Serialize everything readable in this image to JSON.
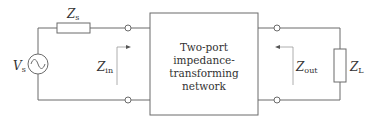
{
  "diagram": {
    "source": {
      "symbol": "V",
      "subscript": "s"
    },
    "source_impedance": {
      "symbol": "Z",
      "subscript": "s"
    },
    "input_impedance": {
      "symbol": "Z",
      "subscript": "in"
    },
    "output_impedance": {
      "symbol": "Z",
      "subscript": "out"
    },
    "load_impedance": {
      "symbol": "Z",
      "subscript": "L"
    },
    "network": {
      "lines": [
        "Two-port",
        "impedance-",
        "transforming",
        "network"
      ]
    },
    "colors": {
      "wire": "#6b6b6b",
      "text": "#333333",
      "background": "#ffffff"
    }
  }
}
